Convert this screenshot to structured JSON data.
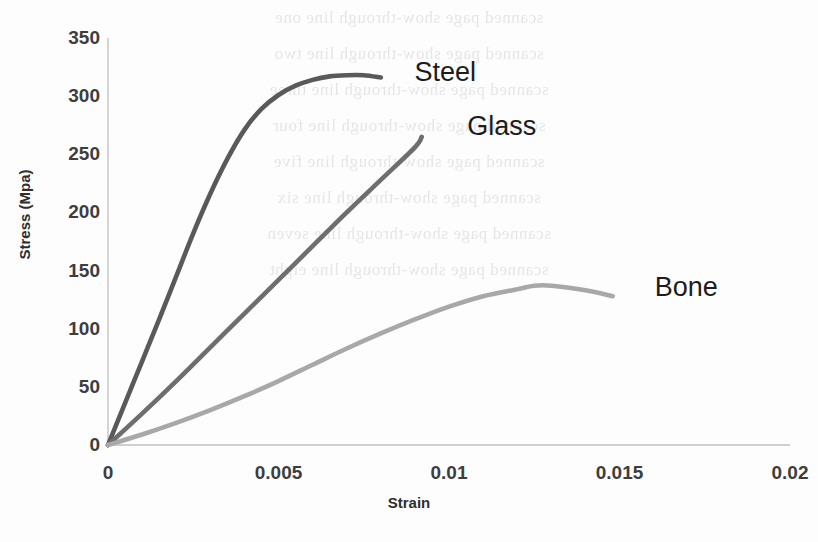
{
  "chart_data": {
    "type": "line",
    "title": "",
    "xlabel": "Strain",
    "ylabel": "Stress (Mpa)",
    "xlim": [
      0,
      0.02
    ],
    "ylim": [
      0,
      350
    ],
    "xticks": [
      "0",
      "0.005",
      "0.01",
      "0.015",
      "0.02"
    ],
    "xtick_values": [
      0,
      0.005,
      0.01,
      0.015,
      0.02
    ],
    "yticks": [
      "0",
      "50",
      "100",
      "150",
      "200",
      "250",
      "300",
      "350"
    ],
    "ytick_values": [
      0,
      50,
      100,
      150,
      200,
      250,
      300,
      350
    ],
    "grid": false,
    "legend_position": "inline-annotations",
    "series": [
      {
        "name": "Steel",
        "color": "#595959",
        "label_x": 0.00875,
        "label_y": 318,
        "points": [
          [
            0.0,
            0
          ],
          [
            0.0005,
            36
          ],
          [
            0.001,
            72
          ],
          [
            0.0015,
            108
          ],
          [
            0.002,
            145
          ],
          [
            0.0025,
            182
          ],
          [
            0.003,
            216
          ],
          [
            0.0035,
            246
          ],
          [
            0.004,
            271
          ],
          [
            0.0045,
            289
          ],
          [
            0.005,
            301
          ],
          [
            0.0055,
            309
          ],
          [
            0.006,
            314
          ],
          [
            0.0065,
            317
          ],
          [
            0.007,
            318
          ],
          [
            0.0075,
            318
          ],
          [
            0.008,
            316
          ]
        ]
      },
      {
        "name": "Glass",
        "color": "#6e6e6e",
        "label_x": 0.0103,
        "label_y": 272,
        "points": [
          [
            0.0,
            0
          ],
          [
            0.001,
            27
          ],
          [
            0.002,
            55
          ],
          [
            0.003,
            84
          ],
          [
            0.004,
            113
          ],
          [
            0.005,
            142
          ],
          [
            0.006,
            171
          ],
          [
            0.007,
            200
          ],
          [
            0.008,
            228
          ],
          [
            0.009,
            256
          ],
          [
            0.0092,
            265
          ]
        ]
      },
      {
        "name": "Bone",
        "color": "#a8a8a8",
        "label_x": 0.0158,
        "label_y": 133,
        "points": [
          [
            0.0,
            0
          ],
          [
            0.001,
            9
          ],
          [
            0.002,
            19
          ],
          [
            0.003,
            30
          ],
          [
            0.004,
            42
          ],
          [
            0.005,
            55
          ],
          [
            0.006,
            69
          ],
          [
            0.007,
            83
          ],
          [
            0.008,
            96
          ],
          [
            0.009,
            108
          ],
          [
            0.01,
            119
          ],
          [
            0.011,
            128
          ],
          [
            0.012,
            134
          ],
          [
            0.0125,
            137
          ],
          [
            0.013,
            137
          ],
          [
            0.014,
            133
          ],
          [
            0.0148,
            128
          ]
        ]
      }
    ]
  },
  "background_ghost_text": [
    "scanned page show-through line one",
    "scanned page show-through line two",
    "scanned page show-through line three",
    "scanned page show-through line four",
    "scanned page show-through line five",
    "scanned page show-through line six",
    "scanned page show-through line seven",
    "scanned page show-through line eight"
  ],
  "axis": {
    "line_color": "#bfbfbf"
  }
}
